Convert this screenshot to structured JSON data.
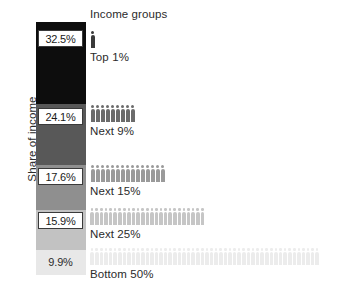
{
  "chart_data": {
    "type": "bar",
    "title": "",
    "ylabel": "Share of income",
    "xlabel": "",
    "legend_title": "Income groups",
    "categories": [
      "Top 1%",
      "Next 9%",
      "Next 15%",
      "Next 25%",
      "Bottom 50%"
    ],
    "values": [
      32.5,
      24.1,
      17.6,
      15.9,
      9.9
    ],
    "value_labels": [
      "32.5%",
      "24.1%",
      "17.6%",
      "15.9%",
      "9.9%"
    ],
    "population_counts": [
      1,
      9,
      15,
      25,
      50
    ],
    "segment_colors": [
      "#0d0d0d",
      "#585858",
      "#8f8f8f",
      "#c2c2c2",
      "#e8e8e8"
    ],
    "stacked": true,
    "ylim": [
      0,
      100
    ],
    "grid": false,
    "legend_position": "right"
  },
  "axis": {
    "y_title": "Share of income"
  },
  "legend": {
    "title": "Income groups",
    "groups": [
      {
        "label": "Top 1%",
        "count": 1,
        "color": "#3a3a3a",
        "value": "32.5%"
      },
      {
        "label": "Next 9%",
        "count": 9,
        "color": "#6b6b6b",
        "value": "24.1%"
      },
      {
        "label": "Next 15%",
        "count": 15,
        "color": "#9a9a9a",
        "value": "17.6%"
      },
      {
        "label": "Next 25%",
        "count": 25,
        "color": "#c6c6c6",
        "value": "15.9%"
      },
      {
        "label": "Bottom 50%",
        "count": 50,
        "color": "#ececec",
        "value": "9.9%"
      }
    ]
  },
  "bar": {
    "segments": [
      {
        "value_label": "32.5%",
        "color": "#0d0d0d",
        "boxed": true
      },
      {
        "value_label": "24.1%",
        "color": "#585858",
        "boxed": true
      },
      {
        "value_label": "17.6%",
        "color": "#8f8f8f",
        "boxed": true
      },
      {
        "value_label": "15.9%",
        "color": "#c2c2c2",
        "boxed": true
      },
      {
        "value_label": "9.9%",
        "color": "#e8e8e8",
        "boxed": false
      }
    ]
  }
}
